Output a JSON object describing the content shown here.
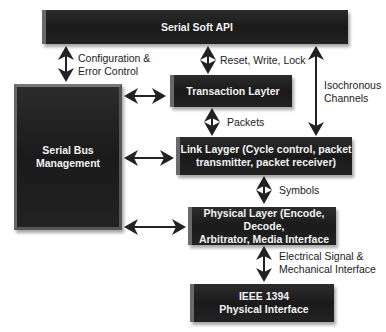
{
  "diagram": {
    "nodes": {
      "api": "Serial Soft API",
      "transaction": "Transaction Layter",
      "bus_mgmt_line1": "Serial Bus",
      "bus_mgmt_line2": "Management",
      "link_line1": "Link Layger (Cycle control, packet",
      "link_line2": "transmitter, packet receiver)",
      "physical_line1": "Physical Layer (Encode, Decode,",
      "physical_line2": "Arbitrator, Media Interface",
      "ieee_line1": "IEEE 1394",
      "ieee_line2": "Physical Interface"
    },
    "edges": {
      "config_line1": "Configuration &",
      "config_line2": "Error Control",
      "rwl": "Reset, Write, Lock",
      "iso_line1": "Isochronous",
      "iso_line2": "Channels",
      "packets": "Packets",
      "symbols": "Symbols",
      "elec_line1": "Electrical Signal &",
      "elec_line2": "Mechanical Interface"
    }
  }
}
